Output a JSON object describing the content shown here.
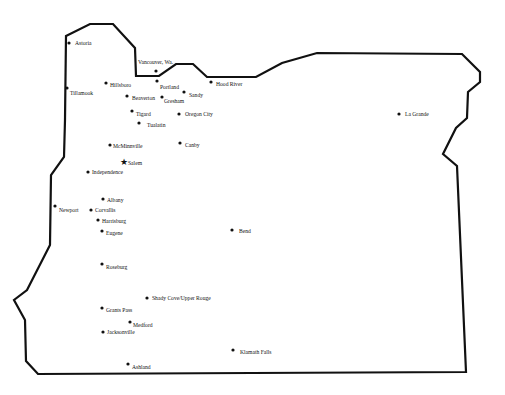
{
  "map": {
    "region": "Oregon",
    "colors": {
      "background": "#ffffff",
      "border": "#111111",
      "text": "#111111"
    },
    "border_points": [
      [
        66,
        36
      ],
      [
        90,
        24
      ],
      [
        113,
        24
      ],
      [
        135,
        48
      ],
      [
        136,
        76
      ],
      [
        159,
        76
      ],
      [
        176,
        64
      ],
      [
        193,
        64
      ],
      [
        207,
        77
      ],
      [
        256,
        77
      ],
      [
        282,
        63
      ],
      [
        317,
        53
      ],
      [
        462,
        54
      ],
      [
        480,
        72
      ],
      [
        480,
        82
      ],
      [
        468,
        92
      ],
      [
        467,
        118
      ],
      [
        456,
        128
      ],
      [
        443,
        154
      ],
      [
        457,
        166
      ],
      [
        466,
        372
      ],
      [
        38,
        374
      ],
      [
        26,
        361
      ],
      [
        25,
        320
      ],
      [
        14,
        300
      ],
      [
        27,
        290
      ],
      [
        50,
        245
      ],
      [
        51,
        175
      ],
      [
        64,
        157
      ],
      [
        65,
        120
      ]
    ],
    "cities": [
      {
        "name": "Astoria",
        "x": 69,
        "y": 43,
        "lx": 75,
        "ly": 45
      },
      {
        "name": "Tillamook",
        "x": 67,
        "y": 88,
        "lx": 70,
        "ly": 95
      },
      {
        "name": "Vancouver, Wa.",
        "x": 156,
        "y": 71,
        "lx": 138,
        "ly": 64
      },
      {
        "name": "Hillsboro",
        "x": 106,
        "y": 83,
        "lx": 110,
        "ly": 87
      },
      {
        "name": "Portland",
        "x": 157,
        "y": 81,
        "lx": 160,
        "ly": 89
      },
      {
        "name": "Hood River",
        "x": 211,
        "y": 82,
        "lx": 216,
        "ly": 86
      },
      {
        "name": "Sandy",
        "x": 184,
        "y": 92,
        "lx": 189,
        "ly": 97
      },
      {
        "name": "Beaverton",
        "x": 127,
        "y": 96,
        "lx": 132,
        "ly": 100
      },
      {
        "name": "Gresham",
        "x": 162,
        "y": 97,
        "lx": 164,
        "ly": 103
      },
      {
        "name": "Tigard",
        "x": 132,
        "y": 111,
        "lx": 136,
        "ly": 116
      },
      {
        "name": "Oregon City",
        "x": 179,
        "y": 114,
        "lx": 185,
        "ly": 116
      },
      {
        "name": "Tualatin",
        "x": 139,
        "y": 123,
        "lx": 147,
        "ly": 127
      },
      {
        "name": "La Grande",
        "x": 399,
        "y": 114,
        "lx": 405,
        "ly": 116
      },
      {
        "name": "McMinnville",
        "x": 110,
        "y": 145,
        "lx": 113,
        "ly": 148
      },
      {
        "name": "Canby",
        "x": 180,
        "y": 143,
        "lx": 185,
        "ly": 147
      },
      {
        "name": "Salem",
        "x": 124,
        "y": 162,
        "lx": 128,
        "ly": 165,
        "capital": true
      },
      {
        "name": "Independence",
        "x": 88,
        "y": 172,
        "lx": 92,
        "ly": 174
      },
      {
        "name": "Albany",
        "x": 103,
        "y": 199,
        "lx": 107,
        "ly": 202
      },
      {
        "name": "Newport",
        "x": 55,
        "y": 206,
        "lx": 59,
        "ly": 212
      },
      {
        "name": "Corvallis",
        "x": 91,
        "y": 210,
        "lx": 95,
        "ly": 212
      },
      {
        "name": "Harrisburg",
        "x": 98,
        "y": 220,
        "lx": 102,
        "ly": 223
      },
      {
        "name": "Bend",
        "x": 232,
        "y": 230,
        "lx": 239,
        "ly": 233
      },
      {
        "name": "Eugene",
        "x": 102,
        "y": 231,
        "lx": 106,
        "ly": 235
      },
      {
        "name": "Roseburg",
        "x": 102,
        "y": 264,
        "lx": 106,
        "ly": 269
      },
      {
        "name": "Shady Cove/Upper Rouge",
        "x": 147,
        "y": 298,
        "lx": 152,
        "ly": 300
      },
      {
        "name": "Grants Pass",
        "x": 102,
        "y": 308,
        "lx": 106,
        "ly": 312
      },
      {
        "name": "Medford",
        "x": 130,
        "y": 322,
        "lx": 133,
        "ly": 327
      },
      {
        "name": "Jacksonville",
        "x": 103,
        "y": 332,
        "lx": 107,
        "ly": 334
      },
      {
        "name": "Klamath Falls",
        "x": 233,
        "y": 350,
        "lx": 240,
        "ly": 354
      },
      {
        "name": "Ashland",
        "x": 128,
        "y": 364,
        "lx": 132,
        "ly": 369
      }
    ]
  }
}
